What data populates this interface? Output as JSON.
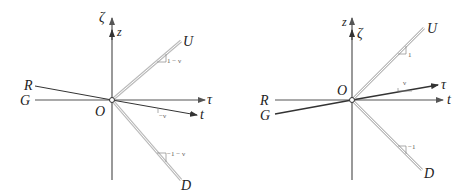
{
  "figure": {
    "colors": {
      "axis": "#555555",
      "line": "#333333",
      "double_line": "#bbbbbb",
      "text": "#222222"
    },
    "left_panel": {
      "labels": {
        "zeta": "ζ",
        "z": "z",
        "U": "U",
        "R": "R",
        "G": "G",
        "O": "O",
        "tau": "τ",
        "t": "t",
        "D": "D"
      },
      "slopes": {
        "U": "1 − ν",
        "t": "−ν",
        "D": "−1 − ν"
      }
    },
    "right_panel": {
      "labels": {
        "z": "z",
        "zeta": "ζ",
        "U": "U",
        "R": "R",
        "G": "G",
        "O": "O",
        "tau": "τ",
        "t": "t",
        "D": "D"
      },
      "slopes": {
        "U": "1",
        "tau": "ν",
        "D": "−1"
      }
    }
  }
}
